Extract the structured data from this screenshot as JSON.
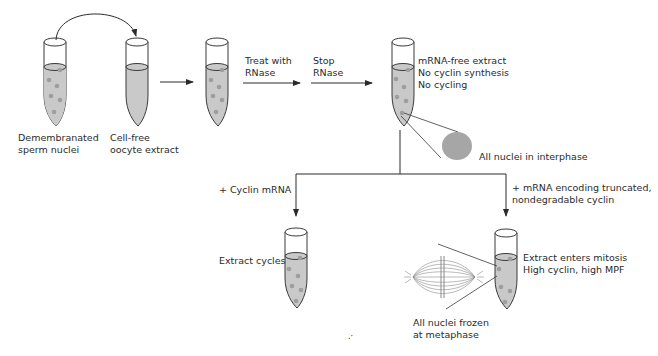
{
  "colors": {
    "fluid": "#c9c9c9",
    "nucleus_dot": "#9e9e9e",
    "outline": "#3a3a3a",
    "interphase_nucleus": "#a6a6a6",
    "background": "#ffffff"
  },
  "tubes": [
    {
      "id": "sperm-nuclei",
      "label_lines": [
        "Demembranated",
        "sperm nuclei"
      ]
    },
    {
      "id": "oocyte-extract",
      "label_lines": [
        "Cell-free",
        "oocyte extract"
      ]
    },
    {
      "id": "combined-extract",
      "label_lines": []
    },
    {
      "id": "mrna-free-extract",
      "label_lines": [
        "mRNA-free extract",
        "No cyclin synthesis",
        "No cycling"
      ]
    },
    {
      "id": "cycling-extract",
      "label_lines": [
        "Extract cycles"
      ]
    },
    {
      "id": "mitotic-extract",
      "label_lines": [
        "Extract enters mitosis",
        "High cyclin, high MPF"
      ]
    }
  ],
  "steps": {
    "treat": [
      "Treat with",
      "RNase"
    ],
    "stop": [
      "Stop",
      "RNase"
    ],
    "branch_left": "+ Cyclin mRNA",
    "branch_right": [
      "+ mRNA encoding truncated,",
      "nondegradable cyclin"
    ]
  },
  "callouts": {
    "interphase": "All nuclei in interphase",
    "metaphase": [
      "All nuclei frozen",
      "at metaphase"
    ]
  },
  "footer_mark": ".·"
}
